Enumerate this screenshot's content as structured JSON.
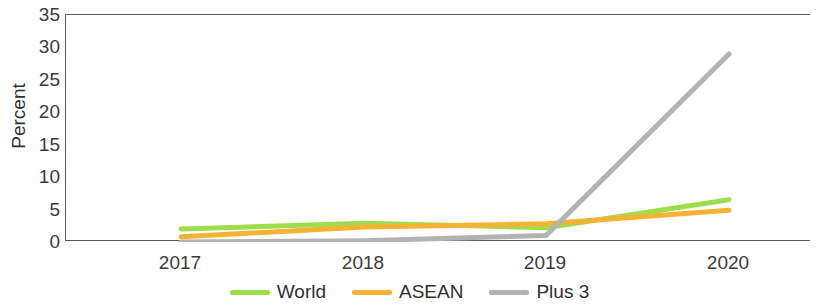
{
  "chart_data": {
    "type": "line",
    "title": "",
    "xlabel": "",
    "ylabel": "Percent",
    "categories": [
      "2017",
      "2018",
      "2019",
      "2020"
    ],
    "x": [
      2017,
      2018,
      2019,
      2020
    ],
    "ylim": [
      0,
      35
    ],
    "yticks": [
      0,
      5,
      10,
      15,
      20,
      25,
      30,
      35
    ],
    "grid": false,
    "legend_position": "bottom",
    "series": [
      {
        "name": "World",
        "color": "#9ede4e",
        "values": [
          2.0,
          2.9,
          2.2,
          6.5
        ]
      },
      {
        "name": "ASEAN",
        "color": "#f5b333",
        "values": [
          0.8,
          2.3,
          2.8,
          4.9
        ]
      },
      {
        "name": "Plus 3",
        "color": "#b3b3b3",
        "values": [
          0.0,
          0.2,
          1.0,
          29.0
        ]
      }
    ]
  },
  "axis": {
    "y_title": "Percent",
    "y_tick_labels": [
      "35",
      "30",
      "25",
      "20",
      "15",
      "10",
      "5",
      "0"
    ],
    "x_tick_labels": [
      "2017",
      "2018",
      "2019",
      "2020"
    ]
  },
  "legend": {
    "items": [
      {
        "label": "World",
        "color": "#9ede4e"
      },
      {
        "label": "ASEAN",
        "color": "#f5b333"
      },
      {
        "label": "Plus 3",
        "color": "#b3b3b3"
      }
    ]
  },
  "colors": {
    "world": "#9ede4e",
    "asean": "#f5b333",
    "plus3": "#b3b3b3",
    "axis": "#5c5c5c",
    "text": "#3b3b3b",
    "background": "#ffffff"
  }
}
